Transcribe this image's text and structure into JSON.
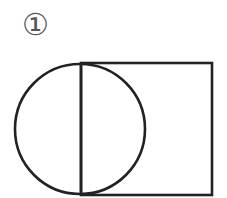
{
  "figure": {
    "label": "①",
    "stroke_color": "#222222",
    "stroke_width": 2.6,
    "rectangle": {
      "x": 81,
      "y": 63,
      "width": 131,
      "height": 132
    },
    "circle": {
      "cx": 80,
      "cy": 129,
      "r": 65
    },
    "vertical_line": {
      "x1": 81,
      "y1": 63,
      "x2": 81,
      "y2": 195
    }
  }
}
